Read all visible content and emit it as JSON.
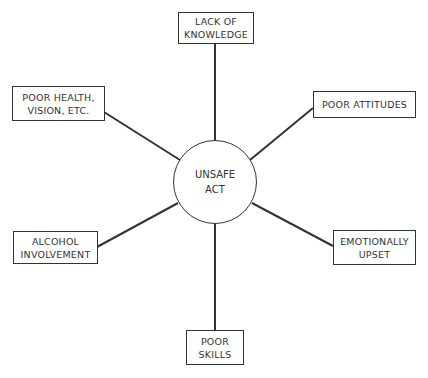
{
  "center": {
    "label": "UNSAFE\nACT"
  },
  "factors": [
    {
      "id": "lack-of-knowledge",
      "label": "LACK OF\nKNOWLEDGE"
    },
    {
      "id": "poor-health",
      "label": "POOR HEALTH,\nVISION, ETC."
    },
    {
      "id": "poor-attitudes",
      "label": "POOR ATTITUDES"
    },
    {
      "id": "alcohol-involvement",
      "label": "ALCOHOL\nINVOLVEMENT"
    },
    {
      "id": "emotionally-upset",
      "label": "EMOTIONALLY\nUPSET"
    },
    {
      "id": "poor-skills",
      "label": "POOR\nSKILLS"
    }
  ],
  "colors": {
    "line": "#333333",
    "background": "#ffffff"
  }
}
